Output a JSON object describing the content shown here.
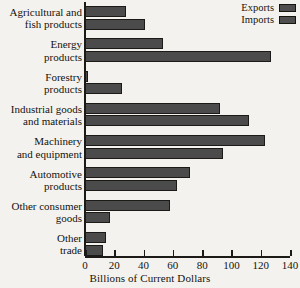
{
  "chart_data": {
    "type": "bar",
    "orientation": "horizontal",
    "title": "",
    "xlabel": "Billions of Current Dollars",
    "ylabel": "",
    "xlim": [
      0,
      140
    ],
    "xticks": [
      0,
      20,
      40,
      60,
      80,
      100,
      120,
      140
    ],
    "grid": false,
    "legend_position": "top-right",
    "categories": [
      "Agricultural and\nfish products",
      "Energy\nproducts",
      "Forestry\nproducts",
      "Industrial goods\nand materials",
      "Machinery\nand equipment",
      "Automotive\nproducts",
      "Other consumer\ngoods",
      "Other\ntrade"
    ],
    "series": [
      {
        "name": "Exports",
        "color": "#4b4b4b",
        "values": [
          28,
          53,
          2,
          92,
          123,
          72,
          58,
          14
        ]
      },
      {
        "name": "Imports",
        "color": "#4b4b4b",
        "values": [
          41,
          127,
          25,
          112,
          94,
          63,
          17,
          12
        ]
      }
    ]
  },
  "legend": {
    "items": [
      {
        "label": "Exports",
        "swatch_color": "#4b4b4b"
      },
      {
        "label": "Imports",
        "swatch_color": "#4b4b4b"
      }
    ]
  },
  "colors": {
    "background": "#f4f2ee",
    "ink": "#15130f",
    "bar_fill": "#4b4b4b",
    "bar_stroke": "#1b1a16"
  }
}
